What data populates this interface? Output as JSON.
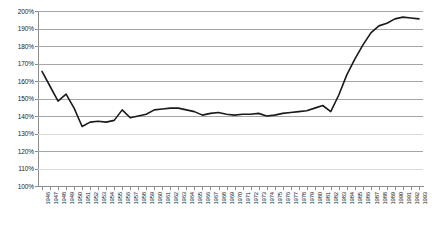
{
  "chart_data": {
    "type": "line",
    "title": "",
    "xlabel": "",
    "ylabel": "",
    "ylim": [
      100,
      200
    ],
    "ytick_step": 10,
    "grid": true,
    "legend": false,
    "legend_position": "none",
    "line_color": "#1a1a1a",
    "grid_color": "#a6a6a6",
    "background_color": "#ffffff",
    "y_tick_labels": [
      "200%",
      "190%",
      "180%",
      "170%",
      "160%",
      "150%",
      "140%",
      "130%",
      "120%",
      "110%",
      "100%"
    ],
    "y_tick_values": [
      200,
      190,
      180,
      170,
      160,
      150,
      140,
      130,
      120,
      110,
      100
    ],
    "categories": [
      "1946",
      "1947",
      "1948",
      "1949",
      "1950",
      "1951",
      "1952",
      "1953",
      "1954",
      "1955",
      "1956",
      "1957",
      "1958",
      "1959",
      "1960",
      "1961",
      "1962",
      "1963",
      "1964",
      "1965",
      "1966",
      "1967",
      "1968",
      "1969",
      "1970",
      "1971",
      "1972",
      "1973",
      "1974",
      "1975",
      "1976",
      "1977",
      "1978",
      "1979",
      "1980",
      "1981",
      "1982",
      "1983",
      "1984",
      "1985",
      "1986",
      "1987",
      "1988",
      "1989",
      "1990",
      "1991",
      "1992",
      "1993"
    ],
    "values": [
      165.5,
      157.0,
      148.5,
      152.5,
      144.5,
      134.0,
      136.5,
      137.0,
      136.5,
      137.5,
      143.5,
      139.0,
      140.0,
      141.0,
      143.5,
      144.0,
      144.5,
      144.5,
      143.5,
      142.5,
      140.5,
      141.5,
      142.0,
      141.0,
      140.5,
      141.0,
      141.0,
      141.5,
      140.0,
      140.5,
      141.5,
      142.0,
      142.5,
      143.0,
      144.5,
      146.0,
      142.5,
      152.0,
      163.5,
      172.5,
      180.5,
      187.5,
      191.5,
      193.0,
      195.5,
      196.5,
      196.0,
      195.5
    ]
  }
}
